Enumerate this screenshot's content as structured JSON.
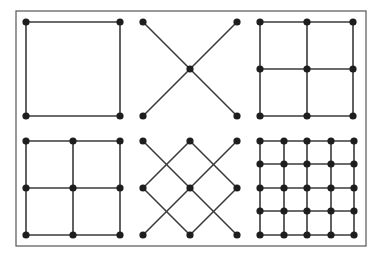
{
  "figure": {
    "colors": {
      "line": "#3a3a3a",
      "dot": "#1e1e1e",
      "frame": "#555555",
      "background": "#ffffff"
    },
    "frame": {
      "x": 16,
      "y": 11,
      "w": 350,
      "h": 235
    },
    "panels": [
      {
        "name": "square",
        "points": [
          [
            26,
            22
          ],
          [
            120,
            22
          ],
          [
            26,
            116
          ],
          [
            120,
            116
          ]
        ],
        "lines": [
          [
            26,
            22,
            120,
            22
          ],
          [
            120,
            22,
            120,
            116
          ],
          [
            120,
            116,
            26,
            116
          ],
          [
            26,
            116,
            26,
            22
          ]
        ]
      },
      {
        "name": "x-cross",
        "points": [
          [
            143,
            22
          ],
          [
            237,
            22
          ],
          [
            190,
            69
          ],
          [
            143,
            116
          ],
          [
            237,
            116
          ]
        ],
        "lines": [
          [
            143,
            22,
            237,
            116
          ],
          [
            237,
            22,
            143,
            116
          ]
        ]
      },
      {
        "name": "grid-3x3-a",
        "points": [
          [
            260,
            22
          ],
          [
            307,
            22
          ],
          [
            353,
            22
          ],
          [
            260,
            69
          ],
          [
            307,
            69
          ],
          [
            353,
            69
          ],
          [
            260,
            116
          ],
          [
            307,
            116
          ],
          [
            353,
            116
          ]
        ],
        "lines": [
          [
            260,
            22,
            353,
            22
          ],
          [
            260,
            69,
            353,
            69
          ],
          [
            260,
            116,
            353,
            116
          ],
          [
            260,
            22,
            260,
            116
          ],
          [
            307,
            22,
            307,
            116
          ],
          [
            353,
            22,
            353,
            116
          ]
        ]
      },
      {
        "name": "grid-3x3-b",
        "points": [
          [
            26,
            141
          ],
          [
            73,
            141
          ],
          [
            120,
            141
          ],
          [
            26,
            188
          ],
          [
            73,
            188
          ],
          [
            120,
            188
          ],
          [
            26,
            235
          ],
          [
            73,
            235
          ],
          [
            120,
            235
          ]
        ],
        "lines": [
          [
            26,
            141,
            120,
            141
          ],
          [
            26,
            188,
            120,
            188
          ],
          [
            26,
            235,
            120,
            235
          ],
          [
            26,
            141,
            26,
            235
          ],
          [
            73,
            141,
            73,
            235
          ],
          [
            120,
            141,
            120,
            235
          ]
        ]
      },
      {
        "name": "diamond-lattice",
        "points": [
          [
            143,
            141
          ],
          [
            190,
            141
          ],
          [
            237,
            141
          ],
          [
            143,
            188
          ],
          [
            190,
            188
          ],
          [
            237,
            188
          ],
          [
            143,
            235
          ],
          [
            190,
            235
          ],
          [
            237,
            235
          ]
        ],
        "lines": [
          [
            143,
            141,
            237,
            235
          ],
          [
            190,
            141,
            237,
            188
          ],
          [
            143,
            188,
            190,
            235
          ],
          [
            237,
            141,
            143,
            235
          ],
          [
            190,
            141,
            143,
            188
          ],
          [
            237,
            188,
            190,
            235
          ]
        ]
      },
      {
        "name": "grid-5x5",
        "points": [
          [
            260,
            141
          ],
          [
            284,
            141
          ],
          [
            307,
            141
          ],
          [
            331,
            141
          ],
          [
            354,
            141
          ],
          [
            260,
            164
          ],
          [
            284,
            164
          ],
          [
            307,
            164
          ],
          [
            331,
            164
          ],
          [
            354,
            164
          ],
          [
            260,
            188
          ],
          [
            284,
            188
          ],
          [
            307,
            188
          ],
          [
            331,
            188
          ],
          [
            354,
            188
          ],
          [
            260,
            211
          ],
          [
            284,
            211
          ],
          [
            307,
            211
          ],
          [
            331,
            211
          ],
          [
            354,
            211
          ],
          [
            260,
            235
          ],
          [
            284,
            235
          ],
          [
            307,
            235
          ],
          [
            331,
            235
          ],
          [
            354,
            235
          ]
        ],
        "lines": [
          [
            260,
            141,
            354,
            141
          ],
          [
            260,
            164,
            354,
            164
          ],
          [
            260,
            188,
            354,
            188
          ],
          [
            260,
            211,
            354,
            211
          ],
          [
            260,
            235,
            354,
            235
          ],
          [
            260,
            141,
            260,
            235
          ],
          [
            284,
            141,
            284,
            235
          ],
          [
            307,
            141,
            307,
            235
          ],
          [
            331,
            141,
            331,
            235
          ],
          [
            354,
            141,
            354,
            235
          ]
        ]
      }
    ]
  }
}
